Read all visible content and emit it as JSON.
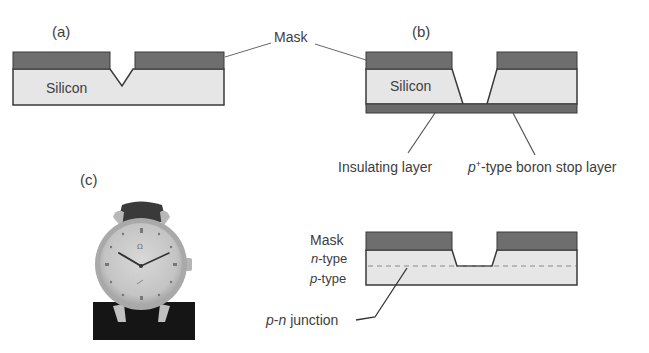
{
  "figure": {
    "panels": {
      "a": {
        "label": "(a)",
        "layer_label": "Silicon"
      },
      "b": {
        "label": "(b)",
        "layer_label": "Silicon",
        "annotations": {
          "insulating": "Insulating layer",
          "stop_layer_prefix": "p",
          "stop_layer_sup": "+",
          "stop_layer_suffix": "-type boron stop layer"
        }
      },
      "c": {
        "label": "(c)",
        "image_description": "wristwatch photo"
      },
      "d": {
        "label": "(d)",
        "mask_label": "Mask",
        "n_type_prefix": "n",
        "n_type_suffix": "-type",
        "p_type_prefix": "p",
        "p_type_suffix": "-type",
        "junction_p": "p",
        "junction_dash": "-",
        "junction_n": "n",
        "junction_suffix": " junction"
      }
    },
    "shared_mask_label": "Mask"
  },
  "colors": {
    "mask": "#6e6e6e",
    "silicon": "#e6e6e6",
    "outline": "#3a3a3a",
    "leader": "#555555",
    "bottom_layer": "#6a6a6a",
    "watch_base": "#151515"
  }
}
